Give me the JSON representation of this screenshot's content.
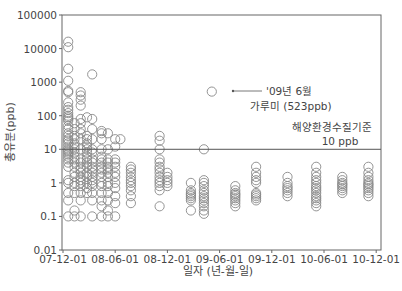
{
  "chart_data": {
    "type": "scatter",
    "title": "",
    "xlabel": "일자 (년-월-일)",
    "ylabel": "총유분(ppb)",
    "yscale": "log",
    "ylim": [
      0.01,
      100000
    ],
    "y_ticks": [
      "0.01",
      "0.1",
      "1",
      "10",
      "100",
      "1000",
      "10000",
      "100000"
    ],
    "x_ticks": [
      "07-12-01",
      "08-06-01",
      "08-12-01",
      "09-06-01",
      "09-12-01",
      "10-06-01",
      "10-12-01"
    ],
    "grid": false,
    "reference_line": {
      "value": 10,
      "label_line1": "해양환경수질기준",
      "label_line2": "10 ppb"
    },
    "annotation": {
      "line1": "'09년 6월",
      "line2": "가루미 (523ppb)",
      "point": {
        "x_tick_offset": 2.85,
        "value": 523
      }
    },
    "series": [
      {
        "name": "총유분",
        "groups": [
          {
            "x": 0.1,
            "values": [
              16000,
              11000,
              2500,
              1100,
              550,
              500,
              250,
              180,
              150,
              120,
              100,
              90,
              80,
              70,
              50,
              40,
              30,
              25,
              20,
              18,
              15,
              12,
              10,
              9,
              8,
              7,
              6,
              5,
              4,
              3,
              1.2,
              1,
              0.5,
              0.3,
              0.1
            ]
          },
          {
            "x": 0.22,
            "values": [
              60,
              40,
              25,
              20,
              15,
              12,
              10,
              8,
              6,
              5,
              4,
              3,
              2,
              1.5,
              1,
              0.8,
              0.5,
              0.15,
              0.1
            ]
          },
          {
            "x": 0.34,
            "values": [
              500,
              400,
              300,
              200,
              80,
              60,
              40,
              30,
              20,
              10,
              5,
              4,
              3,
              2.5,
              2,
              1.5,
              1.2,
              1,
              0.8,
              0.5,
              0.3,
              0.1
            ]
          },
          {
            "x": 0.46,
            "values": [
              90,
              25,
              20,
              15,
              12,
              10,
              8,
              6,
              5,
              4,
              3,
              2,
              1.5,
              1,
              0.7,
              0.5
            ]
          },
          {
            "x": 0.56,
            "values": [
              1700,
              80,
              40,
              20,
              10,
              8,
              5,
              4,
              3,
              2.5,
              2,
              1.5,
              1.2,
              1,
              0.8,
              0.5,
              0.3,
              0.1
            ]
          },
          {
            "x": 0.74,
            "values": [
              35,
              30,
              20,
              10,
              6,
              5,
              4,
              3,
              2.5,
              2,
              1.5,
              1,
              0.8,
              0.5,
              0.3,
              0.2,
              0.1
            ]
          },
          {
            "x": 0.86,
            "values": [
              30,
              10,
              5,
              4,
              3,
              2.5,
              2,
              1.5,
              1,
              0.8,
              0.5,
              0.3,
              0.15,
              0.1
            ]
          },
          {
            "x": 1.0,
            "values": [
              20,
              12,
              5,
              4,
              3,
              2,
              1.5,
              1,
              0.7,
              0.4,
              0.25,
              0.1
            ]
          },
          {
            "x": 1.1,
            "values": [
              20
            ]
          },
          {
            "x": 1.3,
            "values": [
              3,
              2.5,
              2,
              1.5,
              1.2,
              1,
              0.8,
              0.6,
              0.4,
              0.25
            ]
          },
          {
            "x": 1.85,
            "values": [
              25,
              18,
              10,
              5,
              4,
              3,
              2.5,
              2,
              1.5,
              1.2,
              1,
              0.8,
              0.6,
              0.2
            ]
          },
          {
            "x": 2.0,
            "values": [
              2,
              1.5,
              1.2,
              1,
              0.8
            ]
          },
          {
            "x": 2.45,
            "values": [
              1,
              0.6,
              0.5,
              0.45,
              0.4,
              0.35,
              0.3,
              0.15
            ]
          },
          {
            "x": 2.7,
            "values": [
              10,
              1.2,
              1,
              0.8,
              0.6,
              0.5,
              0.4,
              0.35,
              0.3,
              0.25,
              0.2,
              0.15,
              0.12
            ]
          },
          {
            "x": 2.85,
            "values": [
              523
            ]
          },
          {
            "x": 3.3,
            "values": [
              0.8,
              0.6,
              0.5,
              0.45,
              0.4,
              0.35,
              0.3,
              0.25,
              0.2
            ]
          },
          {
            "x": 3.7,
            "values": [
              3,
              2,
              1.5,
              1.2,
              1,
              0.5,
              0.45,
              0.4,
              0.35,
              0.3
            ]
          },
          {
            "x": 4.3,
            "values": [
              1.5,
              1,
              0.8,
              0.7,
              0.6,
              0.5,
              0.4
            ]
          },
          {
            "x": 4.85,
            "values": [
              3,
              2,
              1.5,
              1.2,
              1,
              0.8,
              0.7,
              0.6,
              0.5,
              0.4,
              0.35,
              0.3,
              0.25,
              0.2
            ]
          },
          {
            "x": 5.35,
            "values": [
              1.5,
              1.2,
              1,
              0.9,
              0.8,
              0.7,
              0.6,
              0.5
            ]
          },
          {
            "x": 5.85,
            "values": [
              3,
              2,
              1.5,
              1.2,
              1,
              0.9,
              0.8,
              0.7,
              0.6,
              0.5,
              0.4
            ]
          }
        ]
      }
    ]
  },
  "axes": {
    "xlabel": "일자 (년-월-일)",
    "ylabel": "총유분(ppb)"
  },
  "annotation": {
    "line1": "'09년 6월",
    "line2": "가루미 (523ppb)"
  },
  "reference": {
    "line1": "해양환경수질기준",
    "line2": "10 ppb"
  }
}
